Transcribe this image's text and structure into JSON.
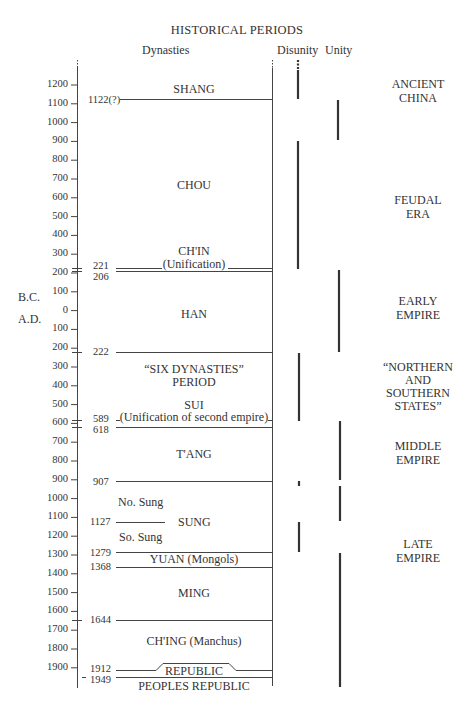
{
  "title": "HISTORICAL PERIODS",
  "headers": {
    "dynasties": "Dynasties",
    "disunity": "Disunity",
    "unity": "Unity"
  },
  "axis": {
    "ticks": [
      "1200",
      "1100",
      "1000",
      "900",
      "800",
      "700",
      "600",
      "500",
      "400",
      "300",
      "200",
      "100",
      "0",
      "100",
      "200",
      "300",
      "400",
      "500",
      "600",
      "700",
      "800",
      "900",
      "1000",
      "1100",
      "1200",
      "1300",
      "1400",
      "1500",
      "1600",
      "1700",
      "1800",
      "1900"
    ],
    "bc_label": "B.C.",
    "ad_label": "A.D."
  },
  "boundary_years": [
    "1122(?)",
    "221",
    "206",
    "222",
    "589",
    "618",
    "907",
    "1127",
    "1279",
    "1368",
    "1644",
    "1912",
    "1949"
  ],
  "dynasties": {
    "shang": "SHANG",
    "chou": "CHOU",
    "chin": "CH'IN",
    "chin_note": "(Unification)",
    "han": "HAN",
    "six_dynasties_1": "“SIX DYNASTIES”",
    "six_dynasties_2": "PERIOD",
    "sui": "SUI",
    "sui_note": "(Unification of second empire)",
    "tang": "T'ANG",
    "no_sung": "No. Sung",
    "sung": "SUNG",
    "so_sung": "So. Sung",
    "yuan": "YUAN (Mongols)",
    "ming": "MING",
    "ching": "CH'ING (Manchus)",
    "republic": "REPUBLIC",
    "peoples_republic": "PEOPLES REPUBLIC"
  },
  "eras": [
    {
      "l1": "ANCIENT",
      "l2": "CHINA"
    },
    {
      "l1": "FEUDAL",
      "l2": "ERA"
    },
    {
      "l1": "EARLY",
      "l2": "EMPIRE"
    },
    {
      "l1": "“NORTHERN",
      "l2": "AND",
      "l3": "SOUTHERN",
      "l4": "STATES”"
    },
    {
      "l1": "MIDDLE",
      "l2": "EMPIRE"
    },
    {
      "l1": "LATE",
      "l2": "EMPIRE"
    }
  ],
  "chart_data": {
    "type": "timeline",
    "title": "HISTORICAL PERIODS",
    "axis_range": [
      -1200,
      1949
    ],
    "dynasties": [
      {
        "name": "SHANG",
        "start": null,
        "end": -1122
      },
      {
        "name": "CHOU",
        "start": -1122,
        "end": -221
      },
      {
        "name": "CH'IN (Unification)",
        "start": -221,
        "end": -206
      },
      {
        "name": "HAN",
        "start": -206,
        "end": 222
      },
      {
        "name": "SIX DYNASTIES PERIOD",
        "start": 222,
        "end": 589
      },
      {
        "name": "SUI (Unification of second empire)",
        "start": 589,
        "end": 618
      },
      {
        "name": "T'ANG",
        "start": 618,
        "end": 907
      },
      {
        "name": "SUNG (No. Sung / So. Sung)",
        "start": 907,
        "end": 1279,
        "split": 1127
      },
      {
        "name": "YUAN (Mongols)",
        "start": 1279,
        "end": 1368
      },
      {
        "name": "MING",
        "start": 1368,
        "end": 1644
      },
      {
        "name": "CH'ING (Manchus)",
        "start": 1644,
        "end": 1912
      },
      {
        "name": "REPUBLIC",
        "start": 1912,
        "end": 1949
      },
      {
        "name": "PEOPLES REPUBLIC",
        "start": 1949,
        "end": null
      }
    ],
    "eras": [
      "ANCIENT CHINA",
      "FEUDAL ERA",
      "EARLY EMPIRE",
      "NORTHERN AND SOUTHERN STATES",
      "MIDDLE EMPIRE",
      "LATE EMPIRE"
    ]
  }
}
